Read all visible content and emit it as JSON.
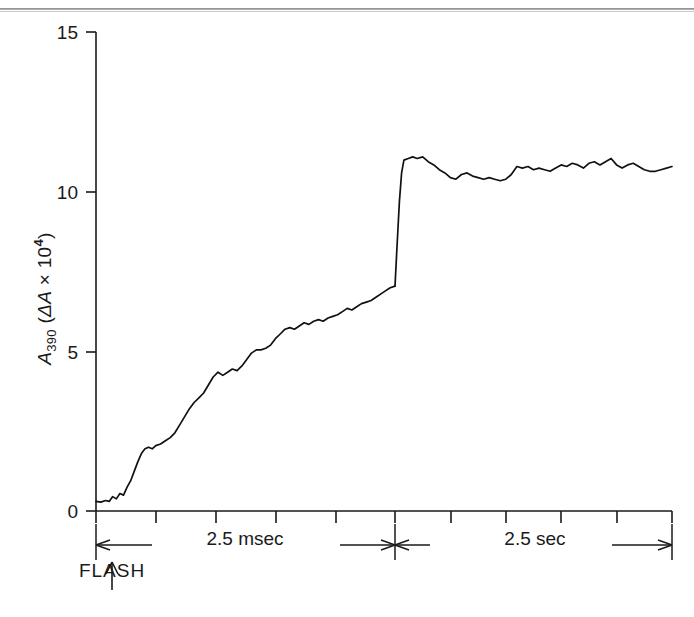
{
  "figure": {
    "type": "kinetic-trace",
    "y_axis": {
      "label_main": "A",
      "label_sub": "390",
      "label_paren_open": "(",
      "label_delta": "ΔA",
      "label_times": " × 10",
      "label_exp": "4",
      "label_paren_close": ")",
      "ticks": [
        "0",
        "5",
        "10",
        "15"
      ],
      "tick_values": [
        0,
        5,
        10,
        15
      ],
      "range": [
        0,
        15
      ]
    },
    "x_axis": {
      "segments": [
        {
          "label": "2.5 msec",
          "unit": "msec",
          "span": 2.5,
          "minor_ticks": 5
        },
        {
          "label": "2.5 sec",
          "unit": "sec",
          "span": 2.5,
          "minor_ticks": 5
        }
      ]
    },
    "annotations": [
      {
        "name": "flash-marker",
        "text": "FLASH",
        "arrow": "up"
      }
    ]
  },
  "chart_data": {
    "type": "line",
    "title": "",
    "xlabel": "",
    "ylabel": "A390 (ΔA × 10^4)",
    "ylim": [
      0,
      15
    ],
    "grid": false,
    "legend": "none",
    "axis_break": true,
    "x_tick_labels": [
      "2.5 msec",
      "2.5 sec"
    ],
    "y_tick_labels": [
      "0",
      "5",
      "10",
      "15"
    ],
    "series": [
      {
        "name": "A390 transient",
        "segment": "msec",
        "comment": "time axis 0 to 2.5 msec following flash",
        "x": [
          0.0,
          0.04,
          0.08,
          0.11,
          0.14,
          0.17,
          0.2,
          0.23,
          0.26,
          0.29,
          0.32,
          0.35,
          0.38,
          0.41,
          0.44,
          0.47,
          0.5,
          0.54,
          0.58,
          0.62,
          0.66,
          0.7,
          0.74,
          0.78,
          0.82,
          0.86,
          0.9,
          0.94,
          0.98,
          1.02,
          1.06,
          1.1,
          1.14,
          1.18,
          1.22,
          1.26,
          1.3,
          1.34,
          1.38,
          1.42,
          1.46,
          1.5,
          1.54,
          1.58,
          1.62,
          1.66,
          1.7,
          1.74,
          1.78,
          1.82,
          1.86,
          1.9,
          1.94,
          1.98,
          2.02,
          2.06,
          2.1,
          2.14,
          2.18,
          2.22,
          2.26,
          2.3,
          2.34,
          2.38,
          2.42,
          2.46,
          2.5
        ],
        "y": [
          0.3,
          0.28,
          0.33,
          0.3,
          0.45,
          0.38,
          0.55,
          0.5,
          0.75,
          0.95,
          1.25,
          1.55,
          1.8,
          1.95,
          2.0,
          1.95,
          2.05,
          2.1,
          2.2,
          2.3,
          2.45,
          2.7,
          2.95,
          3.2,
          3.4,
          3.55,
          3.7,
          3.95,
          4.2,
          4.35,
          4.25,
          4.35,
          4.45,
          4.4,
          4.55,
          4.75,
          4.95,
          5.05,
          5.05,
          5.1,
          5.2,
          5.4,
          5.55,
          5.7,
          5.75,
          5.7,
          5.8,
          5.9,
          5.85,
          5.95,
          6.0,
          5.95,
          6.05,
          6.1,
          6.15,
          6.25,
          6.35,
          6.3,
          6.4,
          6.5,
          6.55,
          6.6,
          6.7,
          6.8,
          6.9,
          7.0,
          7.05
        ]
      },
      {
        "name": "A390 transient",
        "segment": "sec",
        "comment": "time axis 0 to 2.5 sec, sharp rise then plateau",
        "x": [
          0.0,
          0.02,
          0.04,
          0.06,
          0.08,
          0.12,
          0.16,
          0.2,
          0.25,
          0.3,
          0.35,
          0.4,
          0.45,
          0.5,
          0.55,
          0.6,
          0.65,
          0.7,
          0.75,
          0.8,
          0.85,
          0.9,
          0.95,
          1.0,
          1.05,
          1.1,
          1.15,
          1.2,
          1.25,
          1.3,
          1.35,
          1.4,
          1.45,
          1.5,
          1.55,
          1.6,
          1.65,
          1.7,
          1.75,
          1.8,
          1.85,
          1.9,
          1.95,
          2.0,
          2.05,
          2.1,
          2.15,
          2.2,
          2.25,
          2.3,
          2.35,
          2.4,
          2.45,
          2.5
        ],
        "y": [
          7.05,
          8.4,
          9.7,
          10.6,
          11.0,
          11.05,
          11.1,
          11.05,
          11.1,
          10.95,
          10.85,
          10.7,
          10.6,
          10.45,
          10.4,
          10.55,
          10.6,
          10.5,
          10.45,
          10.4,
          10.45,
          10.4,
          10.35,
          10.4,
          10.55,
          10.8,
          10.75,
          10.8,
          10.7,
          10.75,
          10.7,
          10.65,
          10.75,
          10.85,
          10.8,
          10.9,
          10.85,
          10.75,
          10.9,
          10.95,
          10.85,
          10.95,
          11.05,
          10.85,
          10.75,
          10.85,
          10.9,
          10.8,
          10.7,
          10.65,
          10.65,
          10.7,
          10.75,
          10.8
        ]
      }
    ]
  }
}
